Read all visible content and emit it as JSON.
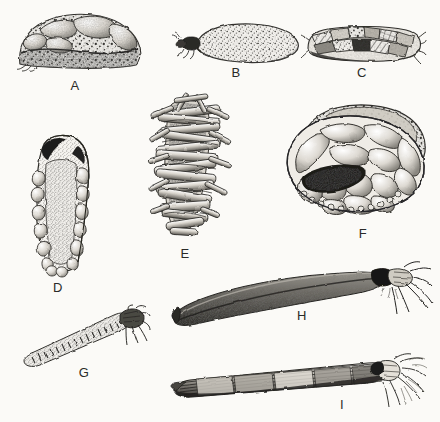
{
  "plate": {
    "title": "Caddisfly larval cases",
    "subject": "Trichoptera larval case types",
    "style": "pen-and-ink stipple illustration",
    "background_color": "#fbfaf7",
    "ink_color": "#2a2a28",
    "width": 440,
    "height": 422,
    "figure_count": 9
  },
  "figures": [
    {
      "id": "A",
      "label": "A",
      "label_x": 75,
      "label_y": 79,
      "description": "Broad dome-shaped case of coarse mineral pebbles and sand grains, viewed laterally",
      "material": "pebbles and coarse sand",
      "orientation": "lateral",
      "larva_visible": false
    },
    {
      "id": "B",
      "label": "B",
      "label_x": 236,
      "label_y": 66,
      "description": "Elongate ovoid sand-grain case with dark larval head and legs protruding from the left anterior opening",
      "material": "fine sand grains",
      "orientation": "lateral",
      "larva_visible": true
    },
    {
      "id": "C",
      "label": "C",
      "label_x": 362,
      "label_y": 66,
      "description": "Cylindrical case built of irregular plant fragments, bark and mineral bits",
      "material": "plant detritus and mineral fragments",
      "orientation": "lateral",
      "larva_visible": false
    },
    {
      "id": "D",
      "label": "D",
      "label_x": 58,
      "label_y": 281,
      "description": "Tapered tubular case of fine sand grains with larger flat stones flanking the margins, dorsal view",
      "material": "fine sand with lateral ballast stones",
      "orientation": "dorsal",
      "larva_visible": false
    },
    {
      "id": "E",
      "label": "E",
      "label_x": 185,
      "label_y": 247,
      "description": "Log-cabin style case constructed from transversely arranged cut twig sections",
      "material": "cut twigs / stem sections",
      "orientation": "lateral",
      "larva_visible": false
    },
    {
      "id": "F",
      "label": "F",
      "label_x": 363,
      "label_y": 227,
      "description": "Broad flattened limpet-like case of flat stones and pebbles with a large ventral aperture",
      "material": "flat stones and pebbles",
      "orientation": "oblique anterior",
      "larva_visible": false
    },
    {
      "id": "G",
      "label": "G",
      "label_x": 84,
      "label_y": 366,
      "description": "Slender tapering tube of minute sand grains; larva with head and thoracic legs emerging at the wide end",
      "material": "minute sand grains",
      "orientation": "oblique",
      "larva_visible": true
    },
    {
      "id": "H",
      "label": "H",
      "label_x": 302,
      "label_y": 309,
      "description": "Long curved horn-shaped silk and fine-sand case, larva with head and legs projecting at the right anterior end",
      "material": "silk with fine sand",
      "orientation": "lateral",
      "larva_visible": true
    },
    {
      "id": "I",
      "label": "I",
      "label_x": 342,
      "label_y": 398,
      "description": "Straight elongate case of longitudinally aligned plant fibres and leaf strips, larva emerging at right",
      "material": "longitudinal plant fibres",
      "orientation": "lateral",
      "larva_visible": true
    }
  ]
}
